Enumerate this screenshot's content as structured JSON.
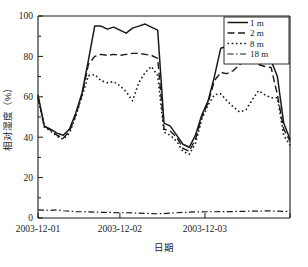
{
  "chart_data": {
    "type": "line",
    "title": "",
    "xlabel": "日期",
    "ylabel": "相对湿度（%）",
    "ylim": [
      0,
      100
    ],
    "yticks": [
      0,
      20,
      40,
      60,
      80,
      100
    ],
    "ytick_labels": [
      "0",
      "20",
      "40",
      "60",
      "80",
      "100"
    ],
    "xlim": [
      0,
      40
    ],
    "xticks": [
      0,
      13,
      26.5,
      40
    ],
    "xtick_labels": [
      "2003-12-01",
      "2003-12-02",
      "2003-12-03",
      ""
    ],
    "grid": false,
    "legend_position": "top-right",
    "legend_entries": [
      "1 m",
      "2 m",
      "8 m",
      "18 m"
    ],
    "x": [
      0,
      1,
      2,
      3,
      4,
      5,
      6,
      7,
      8,
      9,
      10,
      11,
      12,
      13,
      14,
      15,
      16,
      17,
      18,
      19,
      20,
      21,
      22,
      23,
      24,
      25,
      26,
      27,
      28,
      29,
      30,
      31,
      32,
      33,
      34,
      35,
      36,
      37,
      38,
      39,
      40
    ],
    "series": [
      {
        "name": "1 m",
        "style": "solid",
        "values": [
          61,
          45.5,
          44,
          42,
          41,
          44,
          52,
          62,
          78,
          95,
          95,
          93.5,
          94.5,
          93,
          91.5,
          94,
          95,
          96,
          94.5,
          93,
          47,
          45.5,
          41,
          36.5,
          35,
          41,
          51,
          58,
          70,
          84,
          85,
          86.5,
          88,
          87.5,
          86,
          83.5,
          86,
          78,
          70,
          47,
          39
        ]
      },
      {
        "name": "2 m",
        "style": "dashed",
        "values": [
          60,
          45.5,
          43.5,
          41,
          39.5,
          43,
          51,
          61,
          76,
          80,
          81,
          80.5,
          81,
          80.5,
          81,
          81.5,
          81.5,
          81,
          80.5,
          79,
          44,
          43,
          40,
          34.5,
          33,
          39,
          50,
          57,
          68,
          72,
          71.5,
          73,
          76,
          77.5,
          78,
          76,
          75,
          74.5,
          61,
          44,
          38
        ]
      },
      {
        "name": "8 m",
        "style": "dotted",
        "values": [
          59.5,
          45,
          43,
          40.5,
          39,
          42,
          50.5,
          60.5,
          70.5,
          71,
          68,
          67,
          67.5,
          65.5,
          62.5,
          58,
          67,
          72,
          75,
          70.5,
          42.5,
          41,
          38,
          33,
          31.5,
          37,
          49,
          56,
          61,
          61.5,
          58,
          55,
          52.5,
          53.5,
          58.5,
          63,
          61,
          59.5,
          59.5,
          41,
          36
        ]
      },
      {
        "name": "18 m",
        "style": "dashdot",
        "values": [
          4,
          3.9,
          3.8,
          4,
          3.6,
          3.4,
          3.2,
          3.1,
          3,
          2.9,
          2.8,
          2.8,
          2.7,
          2.6,
          2.6,
          2.5,
          2.4,
          2.3,
          2.2,
          2.1,
          2.2,
          2.4,
          2.6,
          2.8,
          2.9,
          3,
          3,
          3.1,
          3.1,
          3.2,
          3.2,
          3.2,
          3.3,
          3.3,
          3.4,
          3.4,
          3.5,
          3.5,
          3.4,
          3.3,
          3.3
        ]
      }
    ]
  }
}
